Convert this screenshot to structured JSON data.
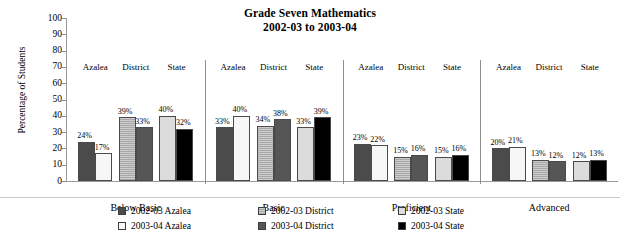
{
  "chart": {
    "title_line1": "Grade Seven Mathematics",
    "title_line2": "2002-03 to 2003-04",
    "ylabel": "Percentage of Students"
  },
  "chart_data": {
    "type": "bar",
    "title": "Grade Seven Mathematics 2002-03 to 2003-04",
    "xlabel": "",
    "ylabel": "Percentage of Students",
    "ylim": [
      0,
      100
    ],
    "ytick_step": 10,
    "yticks": [
      "100",
      "90",
      "80",
      "70",
      "60",
      "50",
      "40",
      "30",
      "20",
      "10",
      "0"
    ],
    "grid": false,
    "legend_position": "bottom",
    "categories": [
      "Below Basic",
      "Basic",
      "Proficient",
      "Advanced"
    ],
    "subgroups": [
      "Azalea",
      "District",
      "State"
    ],
    "series": [
      {
        "name": "2002-03 Azalea",
        "color": "#4b4b4b",
        "subgroup": "Azalea",
        "year": "2002-03",
        "values": [
          24,
          33,
          23,
          20
        ]
      },
      {
        "name": "2003-04 Azalea",
        "color": "#f7f7f7",
        "subgroup": "Azalea",
        "year": "2003-04",
        "values": [
          17,
          40,
          22,
          21
        ]
      },
      {
        "name": "2002-03 District",
        "color": "#a8a8a8",
        "subgroup": "District",
        "year": "2002-03",
        "values": [
          39,
          34,
          15,
          13
        ]
      },
      {
        "name": "2003-04 District",
        "color": "#565656",
        "subgroup": "District",
        "year": "2003-04",
        "values": [
          33,
          38,
          16,
          12
        ]
      },
      {
        "name": "2002-03 State",
        "color": "#dcdcdc",
        "subgroup": "State",
        "year": "2002-03",
        "values": [
          40,
          33,
          15,
          12
        ]
      },
      {
        "name": "2003-04 State",
        "color": "#000000",
        "subgroup": "State",
        "year": "2003-04",
        "values": [
          32,
          39,
          16,
          13
        ]
      }
    ],
    "groups": [
      {
        "label": "Below Basic",
        "subgroups": [
          {
            "label": "Azalea",
            "bars": [
              {
                "value": 24,
                "label": "24%",
                "fill": "f-darkgray"
              },
              {
                "value": 17,
                "label": "17%",
                "fill": "f-white"
              }
            ]
          },
          {
            "label": "District",
            "bars": [
              {
                "value": 39,
                "label": "39%",
                "fill": "f-medgray"
              },
              {
                "value": 33,
                "label": "33%",
                "fill": "f-dkgray2"
              }
            ]
          },
          {
            "label": "State",
            "bars": [
              {
                "value": 40,
                "label": "40%",
                "fill": "f-ltgray"
              },
              {
                "value": 32,
                "label": "32%",
                "fill": "f-black"
              }
            ]
          }
        ]
      },
      {
        "label": "Basic",
        "subgroups": [
          {
            "label": "Azalea",
            "bars": [
              {
                "value": 33,
                "label": "33%",
                "fill": "f-darkgray"
              },
              {
                "value": 40,
                "label": "40%",
                "fill": "f-white"
              }
            ]
          },
          {
            "label": "District",
            "bars": [
              {
                "value": 34,
                "label": "34%",
                "fill": "f-medgray"
              },
              {
                "value": 38,
                "label": "38%",
                "fill": "f-dkgray2"
              }
            ]
          },
          {
            "label": "State",
            "bars": [
              {
                "value": 33,
                "label": "33%",
                "fill": "f-ltgray"
              },
              {
                "value": 39,
                "label": "39%",
                "fill": "f-black"
              }
            ]
          }
        ]
      },
      {
        "label": "Proficient",
        "subgroups": [
          {
            "label": "Azalea",
            "bars": [
              {
                "value": 23,
                "label": "23%",
                "fill": "f-darkgray"
              },
              {
                "value": 22,
                "label": "22%",
                "fill": "f-white"
              }
            ]
          },
          {
            "label": "District",
            "bars": [
              {
                "value": 15,
                "label": "15%",
                "fill": "f-medgray"
              },
              {
                "value": 16,
                "label": "16%",
                "fill": "f-dkgray2"
              }
            ]
          },
          {
            "label": "State",
            "bars": [
              {
                "value": 15,
                "label": "15%",
                "fill": "f-ltgray"
              },
              {
                "value": 16,
                "label": "16%",
                "fill": "f-black"
              }
            ]
          }
        ]
      },
      {
        "label": "Advanced",
        "subgroups": [
          {
            "label": "Azalea",
            "bars": [
              {
                "value": 20,
                "label": "20%",
                "fill": "f-darkgray"
              },
              {
                "value": 21,
                "label": "21%",
                "fill": "f-white"
              }
            ]
          },
          {
            "label": "District",
            "bars": [
              {
                "value": 13,
                "label": "13%",
                "fill": "f-medgray"
              },
              {
                "value": 12,
                "label": "12%",
                "fill": "f-dkgray2"
              }
            ]
          },
          {
            "label": "State",
            "bars": [
              {
                "value": 12,
                "label": "12%",
                "fill": "f-ltgray"
              },
              {
                "value": 13,
                "label": "13%",
                "fill": "f-black"
              }
            ]
          }
        ]
      }
    ],
    "legend": [
      {
        "label": "2002-03 Azalea",
        "fill": "f-darkgray"
      },
      {
        "label": "2002-03 District",
        "fill": "f-medgray"
      },
      {
        "label": "2002-03 State",
        "fill": "f-ltgray"
      },
      {
        "label": "2003-04 Azalea",
        "fill": "f-white"
      },
      {
        "label": "2003-04 District",
        "fill": "f-dkgray2"
      },
      {
        "label": "2003-04 State",
        "fill": "f-black"
      }
    ]
  }
}
